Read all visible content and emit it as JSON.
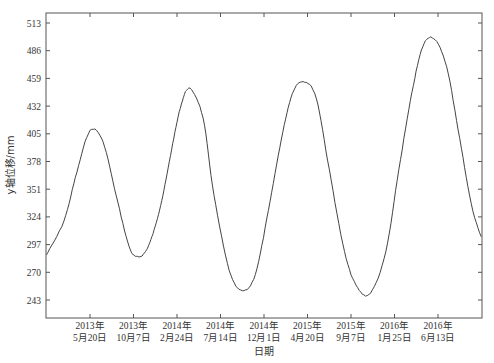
{
  "chart_data": {
    "type": "line",
    "title": "",
    "xlabel": "日期",
    "ylabel": "y轴位移/mm",
    "ylim": [
      234,
      522
    ],
    "yticks": [
      243,
      270,
      297,
      324,
      351,
      378,
      405,
      432,
      459,
      486,
      513
    ],
    "xticks": [
      {
        "line1": "2013年",
        "line2": "5月20日"
      },
      {
        "line1": "2013年",
        "line2": "10月7日"
      },
      {
        "line1": "2014年",
        "line2": "2月24日"
      },
      {
        "line1": "2014年",
        "line2": "7月14日"
      },
      {
        "line1": "2014年",
        "line2": "12月1日"
      },
      {
        "line1": "2015年",
        "line2": "4月20日"
      },
      {
        "line1": "2015年",
        "line2": "9月7日"
      },
      {
        "line1": "2016年",
        "line2": "1月25日"
      },
      {
        "line1": "2016年",
        "line2": "6月13日"
      }
    ],
    "grid": false,
    "legend": null,
    "series": [
      {
        "name": "y轴位移",
        "color": "#444444",
        "x_index": [
          -1.0,
          -0.6,
          -0.3,
          0.0,
          0.3,
          0.6,
          0.9,
          1.1,
          1.3,
          1.5,
          1.7,
          1.9,
          2.1,
          2.3,
          2.6,
          2.85,
          3.2,
          3.5,
          3.8,
          4.1,
          4.4,
          4.65,
          4.9,
          5.2,
          5.5,
          5.85,
          6.15,
          6.45,
          6.8,
          7.1,
          7.4,
          7.65,
          7.9,
          8.2,
          8.5,
          8.8,
          9.1,
          9.3
        ],
        "values": [
          287,
          320,
          368,
          408,
          397,
          345,
          295,
          285,
          292,
          315,
          350,
          395,
          434,
          449,
          420,
          345,
          272,
          252,
          268,
          330,
          400,
          444,
          456,
          440,
          370,
          290,
          255,
          250,
          290,
          370,
          445,
          490,
          498,
          470,
          400,
          330,
          295,
          283
        ]
      }
    ],
    "summary": {
      "peaks": [
        408,
        449,
        456,
        498
      ],
      "troughs": [
        285,
        252,
        250
      ]
    }
  }
}
